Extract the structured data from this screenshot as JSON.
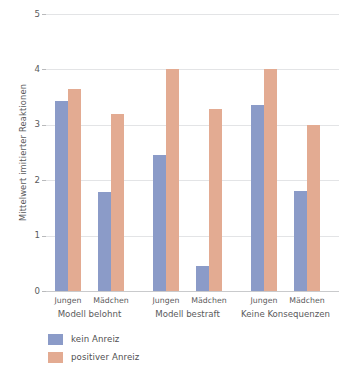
{
  "chart_data": {
    "type": "bar",
    "title": "",
    "xlabel": "",
    "ylabel": "Mittelwert imitierter Reaktionen",
    "ylim": [
      0,
      5
    ],
    "yticks": [
      0,
      1,
      2,
      3,
      4,
      5
    ],
    "ytick_labels": [
      "0",
      "1",
      "2",
      "3",
      "4",
      "5"
    ],
    "grid": true,
    "legend_position": "bottom-left",
    "groups": [
      {
        "label": "Modell belohnt",
        "subcategories": [
          "Jungen",
          "Mädchen"
        ]
      },
      {
        "label": "Modell bestraft",
        "subcategories": [
          "Jungen",
          "Mädchen"
        ]
      },
      {
        "label": "Keine Konsequenzen",
        "subcategories": [
          "Jungen",
          "Mädchen"
        ]
      }
    ],
    "categories": [
      "Modell belohnt / Jungen",
      "Modell belohnt / Mädchen",
      "Modell bestraft / Jungen",
      "Modell bestraft / Mädchen",
      "Keine Konsequenzen / Jungen",
      "Keine Konsequenzen / Mädchen"
    ],
    "series": [
      {
        "name": "kein Anreiz",
        "color": "#8b9bc8",
        "values": [
          3.43,
          1.78,
          2.45,
          0.45,
          3.35,
          1.8
        ]
      },
      {
        "name": "positiver Anreiz",
        "color": "#e3ab92",
        "values": [
          3.65,
          3.2,
          4.0,
          3.28,
          4.0,
          3.0
        ]
      }
    ]
  },
  "legend": {
    "items": [
      {
        "label": "kein Anreiz",
        "swatch": "kein"
      },
      {
        "label": "positiver Anreiz",
        "swatch": "positiv"
      }
    ]
  },
  "colors": {
    "series_kein_anreiz": "#8b9bc8",
    "series_positiver_anreiz": "#e3ab92",
    "gridline": "#e3e4e6",
    "text": "#5a5a5c",
    "background": "#ffffff"
  }
}
